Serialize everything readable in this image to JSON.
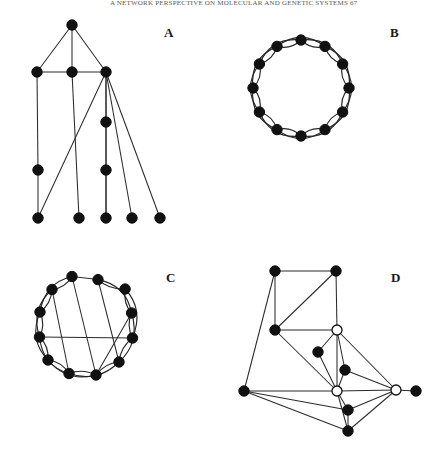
{
  "figure": {
    "header_text": "A NETWORK PERSPECTIVE ON MOLECULAR AND GENETIC SYSTEMS   67",
    "background_color": "#ffffff",
    "node_fill_color": "#111111",
    "node_open_fill_color": "#ffffff",
    "edge_color": "#262626",
    "label_color": "#1a1a1a",
    "panels": [
      {
        "id": "A",
        "label": "A",
        "label_pos": [
          168,
          34
        ],
        "type": "tree-like-graph",
        "node_radius": 5.2,
        "nodes": [
          {
            "id": 0,
            "x": 72,
            "y": 25,
            "style": "filled"
          },
          {
            "id": 1,
            "x": 37,
            "y": 72,
            "style": "filled"
          },
          {
            "id": 2,
            "x": 72,
            "y": 72,
            "style": "filled"
          },
          {
            "id": 3,
            "x": 106,
            "y": 72,
            "style": "filled"
          },
          {
            "id": 4,
            "x": 106,
            "y": 122,
            "style": "filled"
          },
          {
            "id": 5,
            "x": 38,
            "y": 170,
            "style": "filled"
          },
          {
            "id": 6,
            "x": 106,
            "y": 170,
            "style": "filled"
          },
          {
            "id": 7,
            "x": 38,
            "y": 218,
            "style": "filled"
          },
          {
            "id": 8,
            "x": 79,
            "y": 218,
            "style": "filled"
          },
          {
            "id": 9,
            "x": 106,
            "y": 218,
            "style": "filled"
          },
          {
            "id": 10,
            "x": 132,
            "y": 218,
            "style": "filled"
          },
          {
            "id": 11,
            "x": 160,
            "y": 218,
            "style": "filled"
          }
        ],
        "edges": [
          [
            0,
            1
          ],
          [
            0,
            2
          ],
          [
            0,
            3
          ],
          [
            1,
            2
          ],
          [
            2,
            3
          ],
          [
            1,
            5
          ],
          [
            5,
            7
          ],
          [
            2,
            8
          ],
          [
            3,
            4
          ],
          [
            4,
            6
          ],
          [
            6,
            9
          ],
          [
            3,
            7
          ],
          [
            3,
            9
          ],
          [
            3,
            10
          ],
          [
            3,
            11
          ]
        ]
      },
      {
        "id": "B",
        "label": "B",
        "label_pos": [
          394,
          34
        ],
        "type": "circulant-ring-graph",
        "node_count": 12,
        "center": [
          301,
          88
        ],
        "radius": 48,
        "node_radius": 5.2,
        "start_angle_deg": -90,
        "ring_edges": "neighbors (skip 1)",
        "arc_edges": "skip 2, drawn as outward bowed arcs",
        "nodes": [
          {
            "id": 0,
            "x": 301.0,
            "y": 40.0,
            "style": "filled"
          },
          {
            "id": 1,
            "x": 325.0,
            "y": 46.4,
            "style": "filled"
          },
          {
            "id": 2,
            "x": 342.6,
            "y": 64.0,
            "style": "filled"
          },
          {
            "id": 3,
            "x": 349.0,
            "y": 88.0,
            "style": "filled"
          },
          {
            "id": 4,
            "x": 342.6,
            "y": 112.0,
            "style": "filled"
          },
          {
            "id": 5,
            "x": 325.0,
            "y": 129.6,
            "style": "filled"
          },
          {
            "id": 6,
            "x": 301.0,
            "y": 136.0,
            "style": "filled"
          },
          {
            "id": 7,
            "x": 277.0,
            "y": 129.6,
            "style": "filled"
          },
          {
            "id": 8,
            "x": 259.4,
            "y": 112.0,
            "style": "filled"
          },
          {
            "id": 9,
            "x": 253.0,
            "y": 88.0,
            "style": "filled"
          },
          {
            "id": 10,
            "x": 259.4,
            "y": 64.0,
            "style": "filled"
          },
          {
            "id": 11,
            "x": 277.0,
            "y": 46.4,
            "style": "filled"
          }
        ],
        "edges_ring": [
          [
            0,
            1
          ],
          [
            1,
            2
          ],
          [
            2,
            3
          ],
          [
            3,
            4
          ],
          [
            4,
            5
          ],
          [
            5,
            6
          ],
          [
            6,
            7
          ],
          [
            7,
            8
          ],
          [
            8,
            9
          ],
          [
            9,
            10
          ],
          [
            10,
            11
          ],
          [
            11,
            0
          ]
        ],
        "edges_skip2": [
          [
            0,
            2
          ],
          [
            1,
            3
          ],
          [
            2,
            4
          ],
          [
            3,
            5
          ],
          [
            4,
            6
          ],
          [
            5,
            7
          ],
          [
            6,
            8
          ],
          [
            7,
            9
          ],
          [
            8,
            10
          ],
          [
            9,
            11
          ],
          [
            10,
            0
          ],
          [
            11,
            1
          ]
        ]
      },
      {
        "id": "C",
        "label": "C",
        "label_pos": [
          170,
          279
        ],
        "type": "rewired-small-world-graph",
        "node_count": 12,
        "center": [
          86,
          325
        ],
        "radius": 47,
        "node_radius": 5.2,
        "start_angle_deg": -75,
        "nodes": [
          {
            "id": 0,
            "x": 98.0,
            "y": 279.6,
            "style": "filled"
          },
          {
            "id": 1,
            "x": 125.1,
            "y": 289.0,
            "style": "filled"
          },
          {
            "id": 2,
            "x": 131.6,
            "y": 313.0,
            "style": "filled"
          },
          {
            "id": 3,
            "x": 132.5,
            "y": 338.0,
            "style": "filled"
          },
          {
            "id": 4,
            "x": 119.0,
            "y": 362.0,
            "style": "filled"
          },
          {
            "id": 5,
            "x": 96.0,
            "y": 375.0,
            "style": "filled"
          },
          {
            "id": 6,
            "x": 69.0,
            "y": 373.5,
            "style": "filled"
          },
          {
            "id": 7,
            "x": 48.0,
            "y": 360.0,
            "style": "filled"
          },
          {
            "id": 8,
            "x": 39.5,
            "y": 337.0,
            "style": "filled"
          },
          {
            "id": 9,
            "x": 40.0,
            "y": 312.0,
            "style": "filled"
          },
          {
            "id": 10,
            "x": 52.0,
            "y": 289.5,
            "style": "filled"
          },
          {
            "id": 11,
            "x": 72.0,
            "y": 276.5,
            "style": "filled"
          }
        ],
        "edges_ring": [
          [
            0,
            1
          ],
          [
            1,
            2
          ],
          [
            2,
            3
          ],
          [
            3,
            4
          ],
          [
            4,
            5
          ],
          [
            5,
            6
          ],
          [
            6,
            7
          ],
          [
            7,
            8
          ],
          [
            8,
            9
          ],
          [
            9,
            10
          ],
          [
            10,
            11
          ]
        ],
        "edges_arc": [
          [
            1,
            3
          ],
          [
            2,
            4
          ],
          [
            4,
            6
          ],
          [
            5,
            7
          ],
          [
            6,
            8
          ],
          [
            7,
            9
          ],
          [
            8,
            10
          ],
          [
            9,
            11
          ],
          [
            0,
            2
          ]
        ],
        "edges_rewired_chords": [
          [
            0,
            4
          ],
          [
            8,
            3
          ],
          [
            11,
            5
          ],
          [
            0,
            11
          ],
          [
            10,
            6
          ],
          [
            2,
            5
          ]
        ]
      },
      {
        "id": "D",
        "label": "D",
        "label_pos": [
          395,
          279
        ],
        "type": "mixed-node-graph",
        "node_radius": 5.2,
        "open_node_radius": 5.0,
        "nodes": [
          {
            "id": 0,
            "x": 275,
            "y": 271,
            "style": "filled"
          },
          {
            "id": 1,
            "x": 336,
            "y": 271,
            "style": "filled"
          },
          {
            "id": 2,
            "x": 275,
            "y": 330,
            "style": "filled"
          },
          {
            "id": 3,
            "x": 337,
            "y": 330,
            "style": "open"
          },
          {
            "id": 4,
            "x": 318,
            "y": 352,
            "style": "filled"
          },
          {
            "id": 5,
            "x": 345,
            "y": 370,
            "style": "filled"
          },
          {
            "id": 6,
            "x": 244,
            "y": 391,
            "style": "filled"
          },
          {
            "id": 7,
            "x": 337,
            "y": 391,
            "style": "open"
          },
          {
            "id": 8,
            "x": 396,
            "y": 390,
            "style": "open"
          },
          {
            "id": 9,
            "x": 416,
            "y": 391,
            "style": "filled"
          },
          {
            "id": 10,
            "x": 348,
            "y": 410,
            "style": "filled"
          },
          {
            "id": 11,
            "x": 348,
            "y": 431,
            "style": "filled"
          }
        ],
        "edges": [
          [
            0,
            1
          ],
          [
            0,
            2
          ],
          [
            0,
            6
          ],
          [
            1,
            2
          ],
          [
            1,
            3
          ],
          [
            2,
            3
          ],
          [
            2,
            7
          ],
          [
            3,
            7
          ],
          [
            3,
            5
          ],
          [
            3,
            8
          ],
          [
            3,
            4
          ],
          [
            4,
            7
          ],
          [
            5,
            7
          ],
          [
            5,
            8
          ],
          [
            6,
            7
          ],
          [
            6,
            10
          ],
          [
            6,
            11
          ],
          [
            7,
            8
          ],
          [
            7,
            10
          ],
          [
            7,
            11
          ],
          [
            8,
            9
          ],
          [
            8,
            10
          ],
          [
            8,
            11
          ],
          [
            10,
            11
          ]
        ]
      }
    ]
  }
}
